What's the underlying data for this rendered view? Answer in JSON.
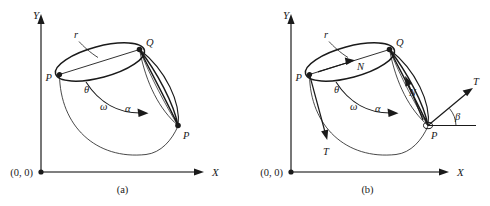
{
  "figure": {
    "background_color": "#ffffff",
    "stroke_color": "#1a1a1a",
    "panels": [
      {
        "id": "a",
        "caption": "(a)",
        "axes": {
          "x_label": "X",
          "y_label": "Y",
          "origin_label": "(0, 0)"
        },
        "labels": {
          "radius": "r",
          "point_p_start": "P",
          "point_q": "Q",
          "point_p_end": "P",
          "theta": "θ",
          "omega": "ω",
          "alpha": "α"
        }
      },
      {
        "id": "b",
        "caption": "(b)",
        "axes": {
          "x_label": "X",
          "y_label": "Y",
          "origin_label": "(0, 0)"
        },
        "labels": {
          "radius": "r",
          "point_p_start": "P",
          "point_q": "Q",
          "point_p_end": "P",
          "theta": "θ",
          "omega": "ω",
          "alpha": "α",
          "beta": "β",
          "normal_top": "N",
          "normal_side": "N",
          "tension_left": "T",
          "tension_right": "T"
        }
      }
    ]
  }
}
